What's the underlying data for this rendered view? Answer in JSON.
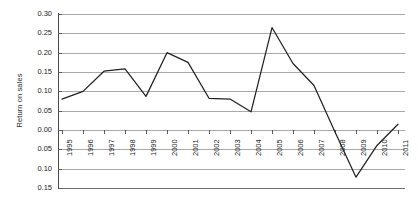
{
  "chart_data": {
    "type": "line",
    "title": "",
    "xlabel": "",
    "ylabel": "Return on sales",
    "categories": [
      "1995",
      "1996",
      "1997",
      "1998",
      "1999",
      "2000",
      "2001",
      "2002",
      "2003",
      "2004",
      "2005",
      "2006",
      "2007",
      "2008",
      "2009",
      "2010",
      "2011"
    ],
    "values": [
      0.08,
      0.1,
      0.152,
      0.158,
      0.087,
      0.2,
      0.175,
      0.082,
      0.08,
      0.047,
      0.265,
      0.172,
      0.115,
      -0.005,
      -0.122,
      -0.04,
      0.015
    ],
    "series": [
      {
        "name": "Return on sales",
        "values": [
          0.08,
          0.1,
          0.152,
          0.158,
          0.087,
          0.2,
          0.175,
          0.082,
          0.08,
          0.047,
          0.265,
          0.172,
          0.115,
          -0.005,
          -0.122,
          -0.04,
          0.015
        ]
      }
    ],
    "ylim": [
      -0.15,
      0.3
    ],
    "ytick_labels": [
      "0.30",
      "0.25",
      "0.20",
      "0.15",
      "0.10",
      "0.05",
      "0.00",
      "0.05",
      "0.10",
      "0.15"
    ],
    "ytick_values": [
      0.3,
      0.25,
      0.2,
      0.15,
      0.1,
      0.05,
      0.0,
      -0.05,
      -0.1,
      -0.15
    ],
    "grid": "horizontal",
    "legend": "none",
    "line_color": "#222222"
  },
  "axis": {
    "y_title": "Return on sales"
  }
}
